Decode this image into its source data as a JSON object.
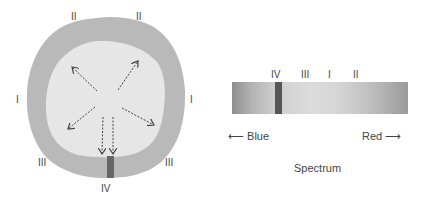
{
  "star": {
    "outer_color": "#b9b9b9",
    "inner_color": "#e6e6e6",
    "notch_color": "#666666",
    "labels": [
      {
        "id": "top-left",
        "text": "II",
        "x": 71,
        "y": 12
      },
      {
        "id": "top-right",
        "text": "II",
        "x": 136,
        "y": 12
      },
      {
        "id": "left",
        "text": "I",
        "x": 16,
        "y": 95
      },
      {
        "id": "right",
        "text": "I",
        "x": 190,
        "y": 95
      },
      {
        "id": "bottom-left",
        "text": "III",
        "x": 38,
        "y": 158
      },
      {
        "id": "bottom-right",
        "text": "III",
        "x": 165,
        "y": 158
      },
      {
        "id": "bottom",
        "text": "IV",
        "x": 101,
        "y": 184
      }
    ]
  },
  "spectrum": {
    "line_labels": [
      {
        "text": "IV",
        "x": 273
      },
      {
        "text": "III",
        "x": 301
      },
      {
        "text": "I",
        "x": 327
      },
      {
        "text": "II",
        "x": 353
      }
    ],
    "absorption_line_x": 43,
    "blue_label": "⟵ Blue",
    "red_label": "Red ⟶",
    "caption": "Spectrum"
  }
}
